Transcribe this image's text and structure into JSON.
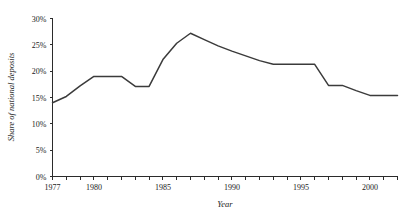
{
  "chart_data": {
    "type": "line",
    "title": "",
    "xlabel": "Year",
    "ylabel": "Share of national deposits",
    "xlim": [
      1977,
      2002
    ],
    "ylim": [
      0,
      30
    ],
    "grid": false,
    "legend": "none",
    "y_tick_labels": [
      "0%",
      "5%",
      "10%",
      "15%",
      "20%",
      "25%",
      "30%"
    ],
    "y_tick_values": [
      0,
      5,
      10,
      15,
      20,
      25,
      30
    ],
    "x_tick_labels": [
      "1977",
      "1980",
      "1985",
      "1990",
      "1995",
      "2000"
    ],
    "x_tick_values": [
      1977,
      1980,
      1985,
      1990,
      1995,
      2000
    ],
    "x_minor_ticks": [
      1978,
      1979,
      1981,
      1982,
      1983,
      1984,
      1986,
      1987,
      1988,
      1989,
      1991,
      1992,
      1993,
      1994,
      1996,
      1997,
      1998,
      1999,
      2001,
      2002
    ],
    "line_color": "#3b3b3b",
    "axis_color": "#2b2b2b",
    "background_color": "#ffffff",
    "x": [
      1977,
      1978,
      1979,
      1980,
      1981,
      1982,
      1983,
      1984,
      1985,
      1986,
      1987,
      1988,
      1989,
      1990,
      1991,
      1992,
      1993,
      1994,
      1995,
      1996,
      1997,
      1998,
      1999,
      2000,
      2001,
      2002
    ],
    "values": [
      14.0,
      15.2,
      17.2,
      19.0,
      19.0,
      19.0,
      17.1,
      17.1,
      22.2,
      25.3,
      27.2,
      26.0,
      24.8,
      23.8,
      22.9,
      22.0,
      21.3,
      21.3,
      21.3,
      21.3,
      17.3,
      17.3,
      16.3,
      15.4,
      15.4,
      15.4
    ],
    "series": [
      {
        "name": "Share of national deposits",
        "values": [
          14.0,
          15.2,
          17.2,
          19.0,
          19.0,
          19.0,
          17.1,
          17.1,
          22.2,
          25.3,
          27.2,
          26.0,
          24.8,
          23.8,
          22.9,
          22.0,
          21.3,
          21.3,
          21.3,
          21.3,
          17.3,
          17.3,
          16.3,
          15.4,
          15.4,
          15.4
        ]
      }
    ]
  }
}
